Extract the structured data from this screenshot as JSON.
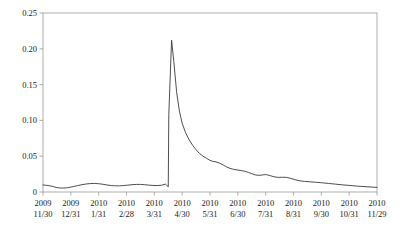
{
  "chart_data": {
    "type": "line",
    "title": "",
    "subtitle": "",
    "xlabel": "",
    "ylabel": "",
    "grid": false,
    "legend": null,
    "ylim": [
      0,
      0.25
    ],
    "yticks": [
      0,
      0.05,
      0.1,
      0.15,
      0.2,
      0.25
    ],
    "ytick_labels": [
      "0",
      "0.05",
      "0.10",
      "0.15",
      "0.20",
      "0.25"
    ],
    "categories": [
      "2009\n11/30",
      "2009\n12/31",
      "2010\n1/31",
      "2010\n2/28",
      "2010\n3/31",
      "2010\n4/30",
      "2010\n5/31",
      "2010\n6/30",
      "2010\n7/31",
      "2010\n8/31",
      "2010\n9/30",
      "2010\n10/31",
      "2010\n11/29"
    ],
    "xtick_labels_top": [
      "2009",
      "2009",
      "2010",
      "2010",
      "2010",
      "2010",
      "2010",
      "2010",
      "2010",
      "2010",
      "2010",
      "2010",
      "2010"
    ],
    "xtick_labels_bottom": [
      "11/30",
      "12/31",
      "1/31",
      "2/28",
      "3/31",
      "4/30",
      "5/31",
      "6/30",
      "7/31",
      "8/31",
      "9/30",
      "10/31",
      "11/29"
    ],
    "line_color": "#3a3a3a",
    "line_width": 0.9,
    "series": [
      {
        "name": "value",
        "x": [
          0.0,
          0.12,
          0.25,
          0.38,
          0.5,
          0.62,
          0.75,
          0.88,
          1.0,
          1.12,
          1.25,
          1.4,
          1.55,
          1.7,
          1.85,
          2.0,
          2.15,
          2.3,
          2.45,
          2.6,
          2.75,
          2.9,
          3.05,
          3.2,
          3.35,
          3.5,
          3.65,
          3.8,
          3.95,
          4.1,
          4.25,
          4.4,
          4.5,
          4.52,
          4.62,
          4.7,
          4.8,
          4.9,
          5.0,
          5.12,
          5.25,
          5.38,
          5.5,
          5.62,
          5.75,
          5.88,
          6.0,
          6.1,
          6.22,
          6.35,
          6.48,
          6.6,
          6.72,
          6.85,
          7.0,
          7.12,
          7.25,
          7.38,
          7.5,
          7.62,
          7.75,
          7.88,
          8.0,
          8.15,
          8.3,
          8.45,
          8.6,
          8.75,
          8.9,
          9.05,
          9.2,
          9.4,
          9.6,
          9.8,
          10.0,
          10.25,
          10.5,
          10.75,
          11.0,
          11.3,
          11.6,
          12.0
        ],
        "y": [
          0.0098,
          0.0094,
          0.0086,
          0.0074,
          0.0062,
          0.0056,
          0.0055,
          0.006,
          0.0068,
          0.0078,
          0.009,
          0.0102,
          0.0112,
          0.0118,
          0.012,
          0.0116,
          0.0108,
          0.0098,
          0.009,
          0.0086,
          0.0086,
          0.009,
          0.0096,
          0.0102,
          0.0106,
          0.0106,
          0.0102,
          0.0096,
          0.0092,
          0.009,
          0.0094,
          0.011,
          0.0072,
          0.108,
          0.212,
          0.182,
          0.14,
          0.113,
          0.096,
          0.083,
          0.073,
          0.065,
          0.059,
          0.054,
          0.05,
          0.047,
          0.0442,
          0.0428,
          0.042,
          0.0402,
          0.0376,
          0.035,
          0.033,
          0.0316,
          0.0306,
          0.03,
          0.029,
          0.0274,
          0.0256,
          0.024,
          0.0232,
          0.0238,
          0.0244,
          0.023,
          0.0212,
          0.0204,
          0.0206,
          0.0204,
          0.019,
          0.0172,
          0.0158,
          0.0148,
          0.0142,
          0.0136,
          0.013,
          0.012,
          0.011,
          0.01,
          0.0092,
          0.0082,
          0.0074,
          0.0064
        ]
      }
    ]
  },
  "axes": {
    "box_color": "#9a9a9a",
    "tick_color": "#9a9a9a"
  }
}
